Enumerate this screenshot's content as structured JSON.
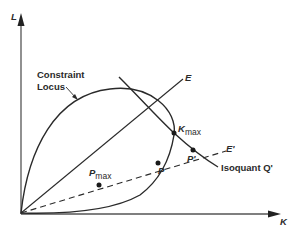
{
  "figure": {
    "axes": {
      "y_label": "L",
      "x_label": "K"
    },
    "curves": {
      "constraint_locus_label_line1": "Constraint",
      "constraint_locus_label_line2": "Locus",
      "expansion_path_label": "E",
      "dashed_path_label": "E'",
      "isoquant_label": "Isoquant Q'"
    },
    "points": {
      "k_max": {
        "main": "K",
        "sub": "max"
      },
      "p_max": {
        "main": "P",
        "sub": "max"
      },
      "p": "P",
      "p_prime": "P'"
    },
    "colors": {
      "ink": "#2a2a2a",
      "axis": "#555555",
      "background": "#ffffff"
    }
  }
}
